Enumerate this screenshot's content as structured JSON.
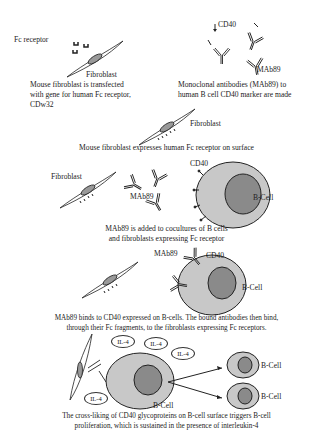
{
  "panel1": {
    "fc_receptor_label": "Fc receptor",
    "fibroblast_label": "Fibroblast",
    "caption_line1": "Mouse fibroblast is transfected",
    "caption_line2": "with gene for human Fc receptor,",
    "caption_line3": "CDw32"
  },
  "panel2": {
    "cd40_label": "CD40",
    "mab_label": "MAb89",
    "caption_line1": "Monoclonal antibodies (MAb89) to",
    "caption_line2": "human B cell CD40 marker are made"
  },
  "panel3": {
    "fibroblast_label": "Fibroblast",
    "caption": "Mouse fibroblast expresses human Fc receptor on surface"
  },
  "panel4": {
    "fibroblast_label": "Fibroblast",
    "mab_label": "MAb89",
    "cd40_label": "CD40",
    "bcell_label": "B-Cell",
    "caption_line1": "MAb89 is added to cocultures of B cells",
    "caption_line2": "and fibroblasts expressing Fc receptor"
  },
  "panel5": {
    "mab_label": "MAb89",
    "cd40_label": "CD40",
    "bcell_label": "B-Cell",
    "caption_line1": "MAb89 binds to CD40 expressed on B-cells. The bound antibodies then bind,",
    "caption_line2": "through their Fc fragments, to the fibroblasts expressing Fc receptors."
  },
  "panel6": {
    "il4_labels": [
      "IL-4",
      "IL-4",
      "IL-4",
      "IL-4"
    ],
    "bcell_label": "B-Cell",
    "daughter_labels": [
      "B-Cell",
      "B-Cell"
    ],
    "caption_line1": "The cross-liking of CD40 glycoproteins on B-cell surface triggers B-cell",
    "caption_line2": "proliferation, which is sustained in the presence of interleukin-4"
  },
  "colors": {
    "cell_body": "#c8c8c8",
    "nucleus": "#8a8a8a",
    "line": "#222222"
  }
}
